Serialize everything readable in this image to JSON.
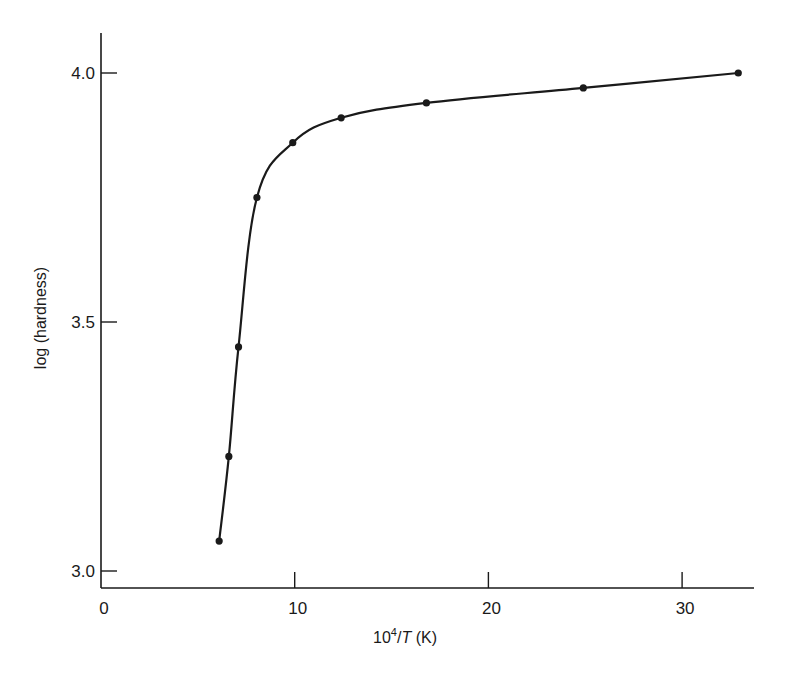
{
  "chart_data": {
    "type": "line",
    "title": "",
    "xlabel": "10^4/T (K)",
    "xlabel_parts": {
      "base": "10",
      "sup": "4",
      "slash": "/",
      "italic": "T",
      "unit": " (K)"
    },
    "ylabel": "log (hardness)",
    "xlim": [
      0,
      34
    ],
    "ylim": [
      2.97,
      4.07
    ],
    "x_ticks": [
      0,
      10,
      20,
      30
    ],
    "x_tick_labels": [
      "0",
      "10",
      "20",
      "30"
    ],
    "y_ticks": [
      3.0,
      3.5,
      4.0
    ],
    "y_tick_labels": [
      "3.0",
      "3.5",
      "4.0"
    ],
    "grid": false,
    "legend": null,
    "series": [
      {
        "name": "log (hardness)",
        "marker": "filled-circle",
        "color": "#1a1a1a",
        "x": [
          6.1,
          6.6,
          7.1,
          8.05,
          9.9,
          12.4,
          16.8,
          24.9,
          32.9
        ],
        "y": [
          3.06,
          3.23,
          3.45,
          3.75,
          3.86,
          3.91,
          3.94,
          3.97,
          4.0
        ]
      }
    ]
  },
  "colors": {
    "ink": "#1a1a1a",
    "background": "#ffffff"
  }
}
